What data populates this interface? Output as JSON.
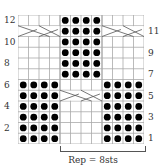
{
  "chart": {
    "columns": 12,
    "rows": 12,
    "grid_color": "#888888",
    "dot_color": "#000000",
    "legend": {
      "dot": "purl stitch",
      "blank": "knit stitch",
      "cross": "cable cross over 4 sts"
    },
    "row_labels_left": [
      "2",
      "4",
      "6",
      "8",
      "10",
      "12"
    ],
    "row_labels_right": [
      "1",
      "3",
      "5",
      "7",
      "9",
      "11"
    ],
    "dots": {
      "rows_1_to_6_cols": [
        1,
        2,
        3,
        4,
        9,
        10,
        11,
        12
      ],
      "rows_7_to_12_cols": [
        5,
        6,
        7,
        8
      ],
      "row_5_exception": "cols 5-8 are cable cross (no dots)",
      "row_11_exception": "cols 1-4 and 9-12 are cable crosses"
    },
    "cables": [
      {
        "row": 11,
        "cols": [
          1,
          4
        ]
      },
      {
        "row": 11,
        "cols": [
          9,
          12
        ]
      },
      {
        "row": 5,
        "cols": [
          5,
          8
        ]
      }
    ]
  },
  "repeat": {
    "label": "Rep = 8sts",
    "start_col": 5,
    "end_col": 12
  }
}
